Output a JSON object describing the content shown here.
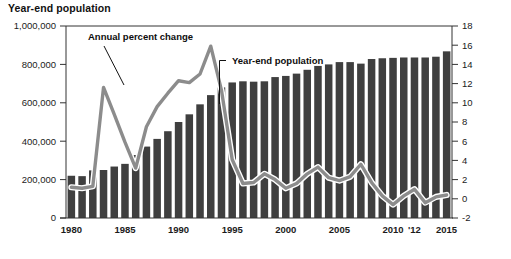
{
  "header": {
    "title": "Year-end population"
  },
  "annotations": [
    {
      "name": "annual-percent-change",
      "label": "Annual percent change",
      "x": 88,
      "y": 40
    },
    {
      "name": "year-end-population",
      "label": "Year-end population",
      "x": 232,
      "y": 64
    }
  ],
  "colors": {
    "bar": "#3f3f3f",
    "line": "#8c8c8c",
    "line_outline": "#ffffff",
    "axis": "#333333",
    "text": "#1a1a1a",
    "background": "#ffffff"
  },
  "chart_data": {
    "type": "bar",
    "title": "Year-end population",
    "xlabel": "",
    "ylabel": "Year-end population",
    "y2label": "Annual percent change",
    "grid": false,
    "legend": "annotations",
    "ylim": [
      0,
      1000000
    ],
    "y2lim": [
      -2,
      18
    ],
    "ytick_labels": [
      "0",
      "200,000",
      "400,000",
      "600,000",
      "800,000",
      "1,000,000"
    ],
    "ytick_values": [
      0,
      200000,
      400000,
      600000,
      800000,
      1000000
    ],
    "y2tick_labels": [
      "-2",
      "0",
      "2",
      "4",
      "6",
      "8",
      "10",
      "12",
      "14",
      "16",
      "18"
    ],
    "y2tick_values": [
      -2,
      0,
      2,
      4,
      6,
      8,
      10,
      12,
      14,
      16,
      18
    ],
    "xtick_labels": [
      "1980",
      "1985",
      "1990",
      "1995",
      "2000",
      "2005",
      "2010",
      "'12",
      "2015"
    ],
    "xtick_years": [
      1980,
      1985,
      1990,
      1995,
      2000,
      2005,
      2010,
      2012,
      2015
    ],
    "categories": [
      1980,
      1981,
      1982,
      1983,
      1984,
      1985,
      1986,
      1987,
      1988,
      1989,
      1990,
      1991,
      1992,
      1993,
      1994,
      1995,
      1996,
      1997,
      1998,
      1999,
      2000,
      2001,
      2002,
      2003,
      2004,
      2005,
      2006,
      2007,
      2008,
      2009,
      2010,
      2011,
      2012,
      2013,
      2014,
      2015
    ],
    "series": [
      {
        "name": "Year-end population",
        "type": "bar",
        "axis": "left",
        "values": [
          220000,
          218000,
          248000,
          250000,
          268000,
          282000,
          328000,
          372000,
          412000,
          452000,
          500000,
          540000,
          592000,
          640000,
          680000,
          706000,
          712000,
          710000,
          712000,
          734000,
          740000,
          752000,
          772000,
          792000,
          800000,
          812000,
          812000,
          804000,
          828000,
          832000,
          834000,
          836000,
          836000,
          836000,
          840000,
          868000
        ]
      },
      {
        "name": "Annual percent change",
        "type": "line",
        "axis": "right",
        "values": [
          1.2,
          1.1,
          1.3,
          11.6,
          8.8,
          5.9,
          3.2,
          7.5,
          9.6,
          11.0,
          12.3,
          12.1,
          13.0,
          15.9,
          11.3,
          4.1,
          1.6,
          1.7,
          2.6,
          2.0,
          1.1,
          1.6,
          2.6,
          3.3,
          2.2,
          1.9,
          2.3,
          3.6,
          1.7,
          0.3,
          -0.6,
          0.3,
          1.0,
          -0.4,
          0.2,
          0.4
        ]
      }
    ]
  }
}
